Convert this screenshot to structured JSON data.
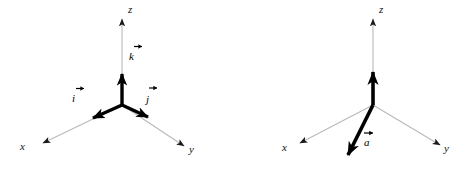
{
  "figure": {
    "background_color": "#ffffff",
    "axis_color": "#b8b8b8",
    "vector_color": "#000000",
    "label_color": "#111111"
  },
  "diagrams": [
    {
      "id": "left",
      "name": "unit-vector-diagram",
      "axes": [
        {
          "name": "z",
          "label": "z",
          "direction": "up"
        },
        {
          "name": "x",
          "label": "x",
          "direction": "down-left"
        },
        {
          "name": "y",
          "label": "y",
          "direction": "down-right"
        }
      ],
      "vectors": [
        {
          "name": "k",
          "label": "k",
          "accent": "arrow",
          "direction": "up"
        },
        {
          "name": "i",
          "label": "i",
          "accent": "arrow",
          "direction": "down-left"
        },
        {
          "name": "j",
          "label": "j",
          "accent": "arrow",
          "direction": "down-right"
        }
      ]
    },
    {
      "id": "right",
      "name": "general-vector-diagram",
      "axes": [
        {
          "name": "z",
          "label": "z",
          "direction": "up"
        },
        {
          "name": "x",
          "label": "x",
          "direction": "down-left"
        },
        {
          "name": "y",
          "label": "y",
          "direction": "down-right"
        }
      ],
      "vectors": [
        {
          "name": "z-component",
          "label": "",
          "accent": "none",
          "direction": "up"
        },
        {
          "name": "a",
          "label": "a",
          "accent": "arrow",
          "direction": "down-left-steep"
        }
      ]
    }
  ],
  "labels": {
    "left_z": "z",
    "left_x": "x",
    "left_y": "y",
    "left_k": "k",
    "left_i": "i",
    "left_j": "j",
    "right_z": "z",
    "right_x": "x",
    "right_y": "y",
    "right_a": "a"
  }
}
